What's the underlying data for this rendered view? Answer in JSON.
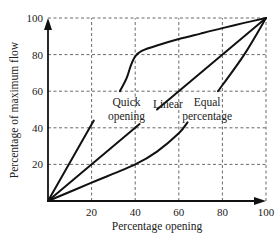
{
  "chart_data": {
    "type": "line",
    "title": "",
    "xlabel": "Percentage opening",
    "ylabel": "Percentage of maximum flow",
    "xlim": [
      0,
      100
    ],
    "ylim": [
      0,
      100
    ],
    "xticks": [
      20,
      40,
      60,
      80,
      100
    ],
    "yticks": [
      20,
      40,
      60,
      80,
      100
    ],
    "grid": true,
    "legend": "none",
    "series": [
      {
        "name": "Quick opening",
        "segments": [
          [
            [
              0,
              0
            ],
            [
              21,
              44
            ]
          ],
          [
            [
              33,
              60
            ],
            [
              36,
              67
            ],
            [
              38,
              74
            ],
            [
              40,
              79
            ],
            [
              43,
              82
            ],
            [
              50,
              85
            ],
            [
              60,
              88.5
            ],
            [
              70,
              91.5
            ],
            [
              80,
              94.5
            ],
            [
              90,
              97.3
            ],
            [
              100,
              100
            ]
          ]
        ]
      },
      {
        "name": "Linear",
        "segments": [
          [
            [
              0,
              0
            ],
            [
              42,
              42
            ]
          ],
          [
            [
              50,
              50
            ],
            [
              100,
              100
            ]
          ]
        ]
      },
      {
        "name": "Equal percentage",
        "segments": [
          [
            [
              0,
              0
            ],
            [
              20,
              10
            ],
            [
              40,
              20
            ],
            [
              50,
              27
            ],
            [
              60,
              37
            ],
            [
              64,
              43
            ]
          ],
          [
            [
              78,
              60
            ],
            [
              90,
              80
            ],
            [
              100,
              100
            ]
          ]
        ]
      }
    ],
    "annotations": [
      {
        "lines": [
          "Quick",
          "opening"
        ],
        "x": 36,
        "y": 52
      },
      {
        "lines": [
          "Linear"
        ],
        "x": 55,
        "y": 51
      },
      {
        "lines": [
          "Equal",
          "percentage"
        ],
        "x": 73,
        "y": 52
      }
    ]
  }
}
